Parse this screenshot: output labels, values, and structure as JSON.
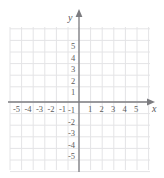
{
  "figure": {
    "kind": "cartesian-coordinate-grid",
    "width": 164,
    "height": 178,
    "background_color": "#ffffff"
  },
  "colors": {
    "grid_line": "#e4e4e6",
    "axis_line": "#7c7c80",
    "tick_text": "#5d5d5d",
    "axis_name_text": "#55555a"
  },
  "axes": {
    "origin_px": {
      "x": 79,
      "y": 102
    },
    "unit_px": 11.6,
    "x_axis": {
      "name": "x",
      "name_px": {
        "x": 152,
        "y": 104
      },
      "arrow": "right",
      "line_from_px": {
        "x": 8,
        "y": 102
      },
      "line_to_px": {
        "x": 150,
        "y": 102
      }
    },
    "y_axis": {
      "name": "y",
      "name_px": {
        "x": 68,
        "y": 13
      },
      "arrow": "up",
      "line_from_px": {
        "x": 79,
        "y": 172
      },
      "line_to_px": {
        "x": 79,
        "y": 14
      }
    }
  },
  "grid": {
    "left_px": 10,
    "right_px": 150,
    "top_px": 27,
    "bottom_px": 170,
    "x_lines_px": [
      10,
      21.6,
      33.2,
      44.8,
      56.4,
      68,
      79,
      90.6,
      102.2,
      113.8,
      125.4,
      137,
      148.6
    ],
    "y_lines_px": [
      28.8,
      40.4,
      52,
      63.6,
      75.2,
      86.8,
      102,
      113.6,
      125.2,
      136.8,
      148.4,
      160,
      171.6
    ]
  },
  "chart_data": {
    "type": "scatter",
    "title": "",
    "xlabel": "x",
    "ylabel": "y",
    "xlim": [
      -6,
      6
    ],
    "ylim": [
      -6,
      6
    ],
    "grid": true,
    "legend": "none",
    "series": [],
    "x_tick_labels": [
      "-5",
      "-4",
      "-3",
      "-2",
      "-1",
      "1",
      "2",
      "3",
      "4",
      "5"
    ],
    "y_tick_labels": [
      "5",
      "4",
      "3",
      "2",
      "1",
      "-1",
      "-2",
      "-3",
      "-4",
      "-5"
    ]
  },
  "x_ticks": [
    {
      "label": "-5",
      "value": -5,
      "px": {
        "x": 13,
        "y": 105
      }
    },
    {
      "label": "-4",
      "value": -4,
      "px": {
        "x": 24.5,
        "y": 105
      }
    },
    {
      "label": "-3",
      "value": -3,
      "px": {
        "x": 36,
        "y": 105
      }
    },
    {
      "label": "-2",
      "value": -2,
      "px": {
        "x": 47.5,
        "y": 105
      }
    },
    {
      "label": "-1",
      "value": -1,
      "px": {
        "x": 59,
        "y": 105
      }
    },
    {
      "label": "1",
      "value": 1,
      "px": {
        "x": 88,
        "y": 105
      }
    },
    {
      "label": "2",
      "value": 2,
      "px": {
        "x": 99.5,
        "y": 105
      }
    },
    {
      "label": "3",
      "value": 3,
      "px": {
        "x": 111,
        "y": 105
      }
    },
    {
      "label": "4",
      "value": 4,
      "px": {
        "x": 122.5,
        "y": 105
      }
    },
    {
      "label": "5",
      "value": 5,
      "px": {
        "x": 134,
        "y": 105
      }
    }
  ],
  "y_ticks": [
    {
      "label": "5",
      "value": 5,
      "px": {
        "x": 71,
        "y": 42
      }
    },
    {
      "label": "4",
      "value": 4,
      "px": {
        "x": 71,
        "y": 53.5
      }
    },
    {
      "label": "3",
      "value": 3,
      "px": {
        "x": 71,
        "y": 65
      }
    },
    {
      "label": "2",
      "value": 2,
      "px": {
        "x": 71,
        "y": 76.5
      }
    },
    {
      "label": "1",
      "value": 1,
      "px": {
        "x": 71,
        "y": 88
      }
    },
    {
      "label": "-1",
      "value": -1,
      "px": {
        "x": 68,
        "y": 106
      }
    },
    {
      "label": "-2",
      "value": -2,
      "px": {
        "x": 68,
        "y": 117.5
      }
    },
    {
      "label": "-3",
      "value": -3,
      "px": {
        "x": 68,
        "y": 129
      }
    },
    {
      "label": "-4",
      "value": -4,
      "px": {
        "x": 68,
        "y": 140.5
      }
    },
    {
      "label": "-5",
      "value": -5,
      "px": {
        "x": 68,
        "y": 152
      }
    }
  ]
}
